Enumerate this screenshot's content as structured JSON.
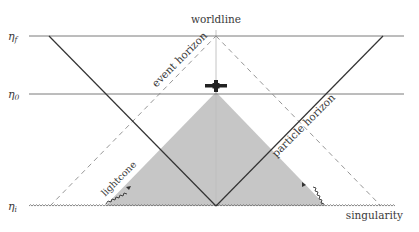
{
  "diagram": {
    "type": "conformal-spacetime-diagram",
    "time_levels": [
      {
        "id": "eta_f",
        "symbol": "η",
        "subscript": "f",
        "y": 36
      },
      {
        "id": "eta_0",
        "symbol": "η",
        "subscript": "0",
        "y": 94
      },
      {
        "id": "eta_i",
        "symbol": "η",
        "subscript": "i",
        "y": 206
      }
    ],
    "labels": {
      "worldline": "worldline",
      "event_horizon": "event horizon",
      "particle_horizon": "particle horizon",
      "lightcone": "lightcone",
      "singularity": "singularity"
    },
    "observer_icon": "satellite-icon",
    "colors": {
      "line": "#3a3a3a",
      "horizontal": "#7a7a7a",
      "dashed": "#8a8a8a",
      "worldline": "#c8c8c8",
      "shaded_region": "#c6c6c6",
      "text": "#3a3a3a"
    }
  }
}
